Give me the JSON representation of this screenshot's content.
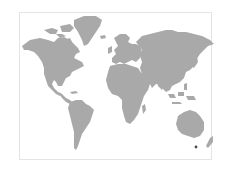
{
  "map": {
    "title": "World map",
    "projection": "equirectangular",
    "colors": {
      "background": "#ffffff",
      "land": "#a9a9a9",
      "frame_border": "#e4e4e4",
      "marker": "#4a4a4a"
    },
    "continents": [
      "North America",
      "Greenland",
      "South America",
      "Europe",
      "Africa",
      "Asia",
      "Australia",
      "New Zealand"
    ],
    "markers": [
      {
        "label": "Tasmania",
        "x": 196,
        "y": 147
      }
    ]
  }
}
